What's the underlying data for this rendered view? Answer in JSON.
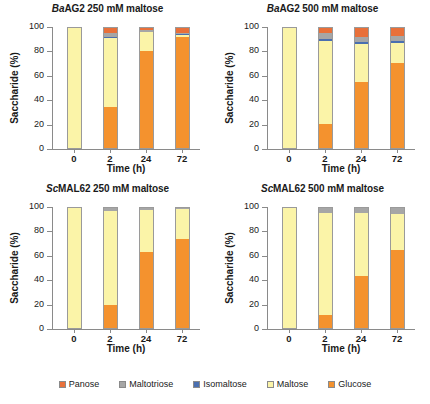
{
  "figure": {
    "ylabel": "Saccharide (%)",
    "xlabel": "Time (h)",
    "ytick_labels": [
      "0",
      "20",
      "40",
      "60",
      "80",
      "100"
    ],
    "xtick_labels": [
      "0",
      "2",
      "24",
      "72"
    ]
  },
  "legend": {
    "items": [
      {
        "label": "Panose",
        "color": "#E8703A"
      },
      {
        "label": "Maltotriose",
        "color": "#A6A6A6"
      },
      {
        "label": "Isomaltose",
        "color": "#4A6FB0"
      },
      {
        "label": "Maltose",
        "color": "#FBF4A8"
      },
      {
        "label": "Glucose",
        "color": "#F4922E"
      }
    ]
  },
  "panels": [
    {
      "title_prefix": "Ba",
      "title_rest": "AG2 250 mM maltose",
      "title_full": "BaAG2 250 mM maltose"
    },
    {
      "title_prefix": "Ba",
      "title_rest": "AG2 500 mM maltose",
      "title_full": "BaAG2 500 mM maltose"
    },
    {
      "title_prefix": "Sc",
      "title_rest": "MAL62 250 mM maltose",
      "title_full": "ScMAL62 250 mM maltose"
    },
    {
      "title_prefix": "Sc",
      "title_rest": "MAL62 500 mM maltose",
      "title_full": "ScMAL62 500 mM maltose"
    }
  ],
  "chart_data": [
    {
      "type": "bar",
      "stacked": true,
      "title": "BaAG2 250 mM maltose",
      "xlabel": "Time (h)",
      "ylabel": "Saccharide (%)",
      "ylim": [
        0,
        100
      ],
      "grid": false,
      "legend_position": "bottom",
      "categories": [
        "0",
        "2",
        "24",
        "72"
      ],
      "series": [
        {
          "name": "Glucose",
          "color": "#F4922E",
          "values": [
            0,
            34.5,
            81.0,
            92.5
          ]
        },
        {
          "name": "Maltose",
          "color": "#FBF4A8",
          "values": [
            100,
            57.5,
            15.5,
            2.0
          ]
        },
        {
          "name": "Isomaltose",
          "color": "#4A6FB0",
          "values": [
            0,
            0.5,
            0.5,
            0.5
          ]
        },
        {
          "name": "Maltotriose",
          "color": "#A6A6A6",
          "values": [
            0,
            3.5,
            1.0,
            1.0
          ]
        },
        {
          "name": "Panose",
          "color": "#E8703A",
          "values": [
            0,
            4.0,
            2.0,
            4.0
          ]
        }
      ]
    },
    {
      "type": "bar",
      "stacked": true,
      "title": "BaAG2 500 mM maltose",
      "xlabel": "Time (h)",
      "ylabel": "Saccharide (%)",
      "ylim": [
        0,
        100
      ],
      "grid": false,
      "legend_position": "bottom",
      "categories": [
        "0",
        "2",
        "24",
        "72"
      ],
      "series": [
        {
          "name": "Glucose",
          "color": "#F4922E",
          "values": [
            0,
            20.0,
            55.0,
            71.0
          ]
        },
        {
          "name": "Maltose",
          "color": "#FBF4A8",
          "values": [
            100,
            69.5,
            31.5,
            16.5
          ]
        },
        {
          "name": "Isomaltose",
          "color": "#4A6FB0",
          "values": [
            0,
            1.0,
            1.5,
            2.0
          ]
        },
        {
          "name": "Maltotriose",
          "color": "#A6A6A6",
          "values": [
            0,
            5.5,
            4.5,
            4.0
          ]
        },
        {
          "name": "Panose",
          "color": "#E8703A",
          "values": [
            0,
            4.0,
            7.5,
            6.5
          ]
        }
      ]
    },
    {
      "type": "bar",
      "stacked": true,
      "title": "ScMAL62 250 mM maltose",
      "xlabel": "Time (h)",
      "ylabel": "Saccharide (%)",
      "ylim": [
        0,
        100
      ],
      "grid": false,
      "legend_position": "bottom",
      "categories": [
        "0",
        "2",
        "24",
        "72"
      ],
      "series": [
        {
          "name": "Glucose",
          "color": "#F4922E",
          "values": [
            0,
            19.5,
            63.5,
            74.0
          ]
        },
        {
          "name": "Maltose",
          "color": "#FBF4A8",
          "values": [
            100,
            78.0,
            35.0,
            25.0
          ]
        },
        {
          "name": "Isomaltose",
          "color": "#4A6FB0",
          "values": [
            0,
            0.0,
            0.0,
            0.0
          ]
        },
        {
          "name": "Maltotriose",
          "color": "#A6A6A6",
          "values": [
            0,
            2.5,
            1.5,
            1.0
          ]
        },
        {
          "name": "Panose",
          "color": "#E8703A",
          "values": [
            0,
            0.0,
            0.0,
            0.0
          ]
        }
      ]
    },
    {
      "type": "bar",
      "stacked": true,
      "title": "ScMAL62 500 mM maltose",
      "xlabel": "Time (h)",
      "ylabel": "Saccharide (%)",
      "ylim": [
        0,
        100
      ],
      "grid": false,
      "legend_position": "bottom",
      "categories": [
        "0",
        "2",
        "24",
        "72"
      ],
      "series": [
        {
          "name": "Glucose",
          "color": "#F4922E",
          "values": [
            0,
            11.0,
            43.0,
            65.0
          ]
        },
        {
          "name": "Maltose",
          "color": "#FBF4A8",
          "values": [
            100,
            85.0,
            53.0,
            30.0
          ]
        },
        {
          "name": "Isomaltose",
          "color": "#4A6FB0",
          "values": [
            0,
            0.0,
            0.0,
            0.0
          ]
        },
        {
          "name": "Maltotriose",
          "color": "#A6A6A6",
          "values": [
            0,
            4.0,
            4.0,
            5.0
          ]
        },
        {
          "name": "Panose",
          "color": "#E8703A",
          "values": [
            0,
            0.0,
            0.0,
            0.0
          ]
        }
      ]
    }
  ]
}
